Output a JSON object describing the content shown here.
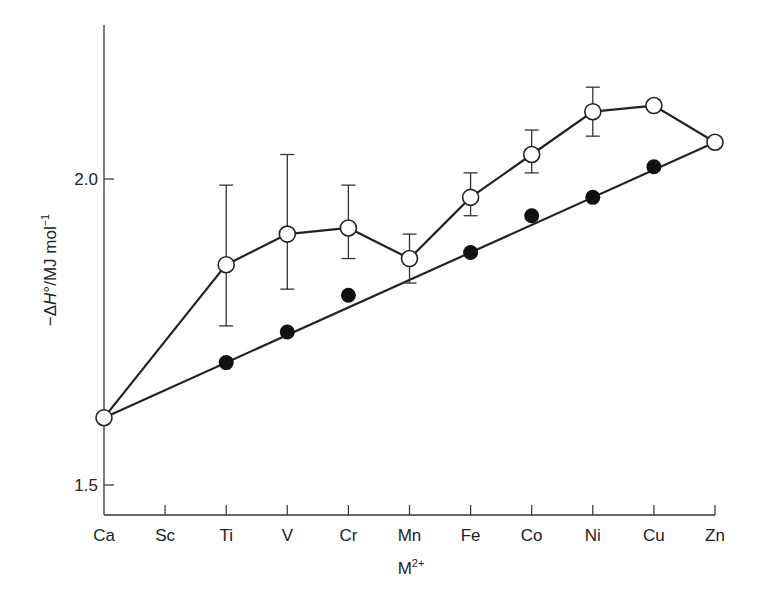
{
  "chart_data": {
    "type": "line",
    "title": "",
    "xlabel": "M2+",
    "xlabel_main": "M",
    "xlabel_sup": "2+",
    "ylabel": "−ΔH°/MJ mol−1",
    "ylabel_parts": {
      "prefix": "−Δ",
      "italic": "H",
      "degree": "°",
      "unit": "/MJ mol",
      "sup": "−1"
    },
    "ylim": [
      1.4,
      2.25
    ],
    "yticks": [
      1.5,
      2.0
    ],
    "ytick_labels": [
      "1.5",
      "2.0"
    ],
    "categories": [
      "Ca",
      "Sc",
      "Ti",
      "V",
      "Cr",
      "Mn",
      "Fe",
      "Co",
      "Ni",
      "Cu",
      "Zn"
    ],
    "grid": false,
    "legend": null,
    "series": [
      {
        "name": "observed (open circles)",
        "marker": "open-circle",
        "x": [
          "Ca",
          "Ti",
          "V",
          "Cr",
          "Mn",
          "Fe",
          "Co",
          "Ni",
          "Cu",
          "Zn"
        ],
        "values": [
          1.61,
          1.86,
          1.91,
          1.92,
          1.87,
          1.97,
          2.04,
          2.11,
          2.12,
          2.06
        ],
        "error_low": [
          null,
          1.76,
          1.82,
          1.87,
          1.83,
          1.94,
          2.01,
          2.07,
          null,
          null
        ],
        "error_high": [
          null,
          1.99,
          2.04,
          1.99,
          1.91,
          2.01,
          2.08,
          2.15,
          null,
          null
        ]
      },
      {
        "name": "corrected (filled circles)",
        "marker": "filled-circle",
        "x": [
          "Ti",
          "V",
          "Cr",
          "Fe",
          "Co",
          "Ni",
          "Cu"
        ],
        "values": [
          1.7,
          1.75,
          1.81,
          1.88,
          1.94,
          1.97,
          2.02
        ]
      },
      {
        "name": "Ca–Zn baseline",
        "marker": "none",
        "x": [
          "Ca",
          "Zn"
        ],
        "values": [
          1.61,
          2.06
        ]
      }
    ]
  }
}
